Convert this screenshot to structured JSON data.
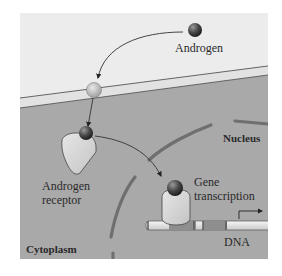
{
  "labels": {
    "androgen": "Androgen",
    "nucleus": "Nucleus",
    "receptor_line1": "Androgen",
    "receptor_line2": "receptor",
    "gene_line1": "Gene",
    "gene_line2": "transcription",
    "dna": "DNA",
    "cytoplasm": "Cytoplasm"
  },
  "colors": {
    "extracellular": "#ececec",
    "membrane": "#e4e4e4",
    "cytoplasm": "#a9a9a9",
    "nuclear_envelope": "#6f6f6f",
    "receptor": "#d6d6d6",
    "hormone": "#4a4a4a",
    "dna": "#e9e9e9"
  }
}
